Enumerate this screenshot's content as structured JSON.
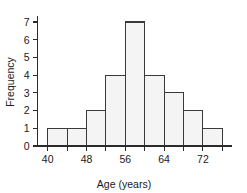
{
  "chart_data": {
    "type": "bar",
    "title": "",
    "xlabel": "Age (years)",
    "ylabel": "Frequency",
    "bin_width": 4,
    "bin_edges": [
      40,
      44,
      48,
      52,
      56,
      60,
      64,
      68,
      72,
      76
    ],
    "categories": [
      "40-44",
      "44-48",
      "48-52",
      "52-56",
      "56-60",
      "60-64",
      "64-68",
      "68-72",
      "72-76"
    ],
    "values": [
      1,
      1,
      2,
      4,
      7,
      4,
      3,
      2,
      1
    ],
    "xlim": [
      38,
      78
    ],
    "ylim": [
      0,
      7
    ],
    "x_tick_values": [
      40,
      44,
      48,
      52,
      56,
      60,
      64,
      68,
      72,
      76
    ],
    "x_tick_labels": [
      "40",
      "",
      "48",
      "",
      "56",
      "",
      "64",
      "",
      "72",
      ""
    ],
    "x_labeled_ticks": [
      {
        "value": 40,
        "label": "40"
      },
      {
        "value": 48,
        "label": "48"
      },
      {
        "value": 56,
        "label": "56"
      },
      {
        "value": 64,
        "label": "64"
      },
      {
        "value": 72,
        "label": "72"
      }
    ],
    "y_tick_values": [
      0,
      1,
      2,
      3,
      4,
      5,
      6,
      7
    ],
    "y_tick_labels": [
      "0",
      "1",
      "2",
      "3",
      "4",
      "5",
      "6",
      "7"
    ],
    "grid": false,
    "legend": null,
    "colors": {
      "bar_fill": "#f4f4f4",
      "bar_stroke": "#3a3a3a",
      "axis": "#2b2b2b",
      "text": "#1a1a1a",
      "background": "#ffffff"
    }
  }
}
